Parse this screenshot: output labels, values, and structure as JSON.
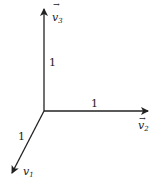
{
  "diagram": {
    "vectors": [
      {
        "name": "v1",
        "label_base": "v",
        "label_sub": "1",
        "has_arrow_accent": false,
        "length_label": "1",
        "direction": "down-left"
      },
      {
        "name": "v2",
        "label_base": "v",
        "label_sub": "2",
        "has_arrow_accent": true,
        "length_label": "1",
        "direction": "right"
      },
      {
        "name": "v3",
        "label_base": "v",
        "label_sub": "3",
        "has_arrow_accent": true,
        "length_label": "1",
        "direction": "up"
      }
    ],
    "accent": "→",
    "stroke_color": "#222222"
  }
}
